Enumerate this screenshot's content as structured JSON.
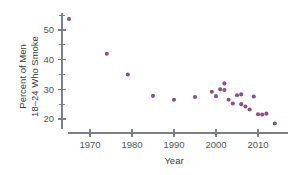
{
  "chart_data": {
    "type": "scatter",
    "title": "",
    "xlabel": "Year",
    "ylabel": "Percent of Men 18–24 Who Smoke",
    "ylabel_line1": "Percent of Men",
    "ylabel_line2": "18–24 Who Smoke",
    "xlim": [
      1963,
      2016
    ],
    "ylim": [
      17,
      55
    ],
    "grid": false,
    "legend": null,
    "marker_color": "#8e4e86",
    "axis_color": "#7d7f86",
    "text_color": "#55565a",
    "xticks": [
      1970,
      1980,
      1990,
      2000,
      2010
    ],
    "xtick_labels": [
      "1970",
      "1980",
      "1990",
      "2000",
      "2010"
    ],
    "yticks": [
      20,
      30,
      40,
      50
    ],
    "ytick_labels": [
      "20",
      "30",
      "40",
      "50"
    ],
    "y_minor_ticks": [
      25,
      35,
      45,
      55
    ],
    "points": [
      {
        "x": 1965,
        "y": 53.7
      },
      {
        "x": 1974,
        "y": 42.0
      },
      {
        "x": 1979,
        "y": 35.0
      },
      {
        "x": 1985,
        "y": 27.8
      },
      {
        "x": 1990,
        "y": 26.5
      },
      {
        "x": 1995,
        "y": 27.4
      },
      {
        "x": 1999,
        "y": 29.2
      },
      {
        "x": 2000,
        "y": 27.7
      },
      {
        "x": 2001,
        "y": 30.0
      },
      {
        "x": 2002,
        "y": 29.8
      },
      {
        "x": 2002,
        "y": 32.0
      },
      {
        "x": 2003,
        "y": 26.5
      },
      {
        "x": 2004,
        "y": 25.2
      },
      {
        "x": 2005,
        "y": 28.0
      },
      {
        "x": 2006,
        "y": 28.3
      },
      {
        "x": 2006,
        "y": 25.0
      },
      {
        "x": 2007,
        "y": 24.2
      },
      {
        "x": 2008,
        "y": 23.2
      },
      {
        "x": 2009,
        "y": 27.6
      },
      {
        "x": 2010,
        "y": 21.6
      },
      {
        "x": 2011,
        "y": 21.5
      },
      {
        "x": 2012,
        "y": 21.8
      },
      {
        "x": 2014,
        "y": 18.5
      }
    ]
  }
}
